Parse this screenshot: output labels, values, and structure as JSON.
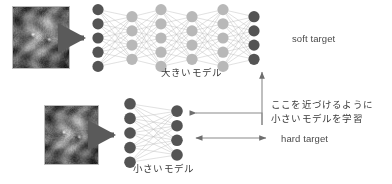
{
  "diagram": {
    "title_hidden": "",
    "teacher": {
      "model_label": "大きいモデル",
      "thumbnail_name": "cat-photo-teacher",
      "arrow_name": "input-arrow-teacher",
      "layers": [
        5,
        4,
        5,
        4,
        5,
        4
      ],
      "output_label": "soft target"
    },
    "student": {
      "model_label": "小さいモデル",
      "thumbnail_name": "cat-photo-student",
      "arrow_name": "input-arrow-student",
      "layers": [
        5,
        4
      ],
      "output_label": "hard target"
    },
    "annotation": {
      "line1": "ここを近づけるように",
      "line2": "小さいモデルを学習"
    },
    "colors": {
      "dark_node": "#545454",
      "light_node": "#b8b8b8",
      "edge": "#bdbdbd",
      "arrow": "#6e6e6e",
      "text": "#3a3a3a",
      "background": "#ffffff"
    }
  }
}
